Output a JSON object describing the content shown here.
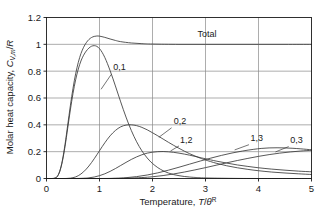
{
  "chart_data": {
    "type": "line",
    "title": "",
    "xlabel": "Temperature, T/θᴿ",
    "xlabel_parts": {
      "prefix": "Temperature, ",
      "var1": "T",
      "slash": "/",
      "var2": "θ",
      "sup": "R"
    },
    "ylabel": "Molar heat capacity, C_V,m/R",
    "ylabel_parts": {
      "prefix": "Molar heat capacity, ",
      "var1": "C",
      "sub": "V,m",
      "slash": "/",
      "var2": "R"
    },
    "xlim": [
      0,
      5
    ],
    "ylim": [
      0,
      1.2
    ],
    "xticks": [
      "0",
      "1",
      "2",
      "3",
      "4",
      "5"
    ],
    "xtick_values": [
      0,
      1,
      2,
      3,
      4,
      5
    ],
    "yticks": [
      "0",
      "0.2",
      "0.4",
      "0.6",
      "0.8",
      "1",
      "1.2"
    ],
    "ytick_values": [
      0,
      0.2,
      0.4,
      0.6,
      0.8,
      1.0,
      1.2
    ],
    "grid": true,
    "grid_color": "#8a8a8a",
    "legend_position": "in-plot-annotations",
    "curve_color": "#3a3a3a",
    "background": "#ffffff",
    "series": [
      {
        "name": "Total",
        "label": "Total",
        "label_x": 2.85,
        "label_y": 1.055,
        "leader": null,
        "points": [
          [
            0.0,
            0.0
          ],
          [
            0.1,
            0.0
          ],
          [
            0.15,
            0.002
          ],
          [
            0.2,
            0.014
          ],
          [
            0.25,
            0.055
          ],
          [
            0.3,
            0.136
          ],
          [
            0.35,
            0.255
          ],
          [
            0.4,
            0.398
          ],
          [
            0.45,
            0.542
          ],
          [
            0.5,
            0.672
          ],
          [
            0.55,
            0.78
          ],
          [
            0.6,
            0.866
          ],
          [
            0.65,
            0.931
          ],
          [
            0.7,
            0.978
          ],
          [
            0.75,
            1.012
          ],
          [
            0.8,
            1.036
          ],
          [
            0.85,
            1.051
          ],
          [
            0.9,
            1.059
          ],
          [
            0.95,
            1.062
          ],
          [
            1.0,
            1.061
          ],
          [
            1.1,
            1.052
          ],
          [
            1.2,
            1.04
          ],
          [
            1.3,
            1.029
          ],
          [
            1.4,
            1.02
          ],
          [
            1.6,
            1.01
          ],
          [
            1.8,
            1.005
          ],
          [
            2.0,
            1.002
          ],
          [
            2.5,
            1.0
          ],
          [
            3.0,
            1.0
          ],
          [
            3.5,
            1.0
          ],
          [
            4.0,
            1.0
          ],
          [
            4.5,
            1.0
          ],
          [
            5.0,
            1.0
          ]
        ]
      },
      {
        "name": "0,1",
        "label": "0,1",
        "label_x": 1.26,
        "label_y": 0.805,
        "leader": [
          [
            1.22,
            0.775
          ],
          [
            1.03,
            0.665
          ]
        ],
        "peak": [
          0.85,
          0.99
        ],
        "points": [
          [
            0.0,
            0.0
          ],
          [
            0.1,
            0.0
          ],
          [
            0.15,
            0.002
          ],
          [
            0.2,
            0.013
          ],
          [
            0.25,
            0.052
          ],
          [
            0.3,
            0.128
          ],
          [
            0.35,
            0.24
          ],
          [
            0.4,
            0.375
          ],
          [
            0.45,
            0.511
          ],
          [
            0.5,
            0.634
          ],
          [
            0.55,
            0.736
          ],
          [
            0.6,
            0.816
          ],
          [
            0.65,
            0.876
          ],
          [
            0.7,
            0.919
          ],
          [
            0.75,
            0.95
          ],
          [
            0.8,
            0.972
          ],
          [
            0.85,
            0.986
          ],
          [
            0.9,
            0.99
          ],
          [
            0.95,
            0.985
          ],
          [
            1.0,
            0.968
          ],
          [
            1.05,
            0.94
          ],
          [
            1.1,
            0.902
          ],
          [
            1.15,
            0.856
          ],
          [
            1.2,
            0.804
          ],
          [
            1.25,
            0.748
          ],
          [
            1.3,
            0.69
          ],
          [
            1.35,
            0.63
          ],
          [
            1.4,
            0.571
          ],
          [
            1.45,
            0.513
          ],
          [
            1.5,
            0.458
          ],
          [
            1.55,
            0.406
          ],
          [
            1.6,
            0.358
          ],
          [
            1.65,
            0.314
          ],
          [
            1.7,
            0.274
          ],
          [
            1.75,
            0.238
          ],
          [
            1.8,
            0.206
          ],
          [
            1.85,
            0.178
          ],
          [
            1.9,
            0.153
          ],
          [
            1.95,
            0.131
          ],
          [
            2.0,
            0.112
          ],
          [
            2.1,
            0.081
          ],
          [
            2.2,
            0.058
          ],
          [
            2.3,
            0.041
          ],
          [
            2.4,
            0.029
          ],
          [
            2.5,
            0.021
          ],
          [
            2.6,
            0.015
          ],
          [
            2.7,
            0.011
          ],
          [
            2.8,
            0.008
          ],
          [
            3.0,
            0.004
          ],
          [
            3.5,
            0.001
          ],
          [
            4.0,
            0.0
          ],
          [
            5.0,
            0.0
          ]
        ]
      },
      {
        "name": "0,2",
        "label": "0,2",
        "label_x": 2.4,
        "label_y": 0.405,
        "leader": [
          [
            2.36,
            0.378
          ],
          [
            2.12,
            0.307
          ]
        ],
        "peak": [
          1.6,
          0.4
        ],
        "points": [
          [
            0.0,
            0.0
          ],
          [
            0.3,
            0.0
          ],
          [
            0.4,
            0.001
          ],
          [
            0.5,
            0.006
          ],
          [
            0.6,
            0.021
          ],
          [
            0.7,
            0.05
          ],
          [
            0.8,
            0.093
          ],
          [
            0.9,
            0.147
          ],
          [
            1.0,
            0.207
          ],
          [
            1.1,
            0.266
          ],
          [
            1.2,
            0.318
          ],
          [
            1.3,
            0.358
          ],
          [
            1.4,
            0.385
          ],
          [
            1.5,
            0.398
          ],
          [
            1.6,
            0.4
          ],
          [
            1.7,
            0.394
          ],
          [
            1.8,
            0.381
          ],
          [
            1.9,
            0.363
          ],
          [
            2.0,
            0.341
          ],
          [
            2.1,
            0.318
          ],
          [
            2.2,
            0.294
          ],
          [
            2.3,
            0.27
          ],
          [
            2.4,
            0.247
          ],
          [
            2.5,
            0.225
          ],
          [
            2.6,
            0.204
          ],
          [
            2.7,
            0.185
          ],
          [
            2.8,
            0.168
          ],
          [
            2.9,
            0.152
          ],
          [
            3.0,
            0.138
          ],
          [
            3.2,
            0.114
          ],
          [
            3.4,
            0.095
          ],
          [
            3.6,
            0.08
          ],
          [
            3.8,
            0.068
          ],
          [
            4.0,
            0.058
          ],
          [
            4.25,
            0.048
          ],
          [
            4.5,
            0.041
          ],
          [
            4.75,
            0.035
          ],
          [
            5.0,
            0.03
          ]
        ]
      },
      {
        "name": "1,2",
        "label": "1,2",
        "label_x": 2.52,
        "label_y": 0.268,
        "leader": [
          [
            2.5,
            0.243
          ],
          [
            2.34,
            0.205
          ]
        ],
        "peak": [
          2.2,
          0.2
        ],
        "points": [
          [
            0.0,
            0.0
          ],
          [
            0.5,
            0.0
          ],
          [
            0.7,
            0.002
          ],
          [
            0.8,
            0.005
          ],
          [
            0.9,
            0.011
          ],
          [
            1.0,
            0.021
          ],
          [
            1.1,
            0.035
          ],
          [
            1.2,
            0.053
          ],
          [
            1.3,
            0.074
          ],
          [
            1.4,
            0.097
          ],
          [
            1.5,
            0.12
          ],
          [
            1.6,
            0.142
          ],
          [
            1.7,
            0.161
          ],
          [
            1.8,
            0.177
          ],
          [
            1.9,
            0.189
          ],
          [
            2.0,
            0.196
          ],
          [
            2.1,
            0.2
          ],
          [
            2.2,
            0.201
          ],
          [
            2.3,
            0.199
          ],
          [
            2.4,
            0.195
          ],
          [
            2.5,
            0.189
          ],
          [
            2.6,
            0.182
          ],
          [
            2.7,
            0.174
          ],
          [
            2.8,
            0.165
          ],
          [
            2.9,
            0.156
          ],
          [
            3.0,
            0.147
          ],
          [
            3.2,
            0.13
          ],
          [
            3.4,
            0.115
          ],
          [
            3.6,
            0.101
          ],
          [
            3.8,
            0.09
          ],
          [
            4.0,
            0.08
          ],
          [
            4.25,
            0.07
          ],
          [
            4.5,
            0.062
          ],
          [
            4.75,
            0.055
          ],
          [
            5.0,
            0.05
          ]
        ]
      },
      {
        "name": "1,3",
        "label": "1,3",
        "label_x": 3.85,
        "label_y": 0.277,
        "leader": [
          [
            3.82,
            0.252
          ],
          [
            3.55,
            0.213
          ]
        ],
        "peak": [
          4.0,
          0.23
        ],
        "points": [
          [
            0.0,
            0.0
          ],
          [
            1.0,
            0.0
          ],
          [
            1.3,
            0.002
          ],
          [
            1.5,
            0.006
          ],
          [
            1.7,
            0.014
          ],
          [
            1.9,
            0.026
          ],
          [
            2.1,
            0.042
          ],
          [
            2.3,
            0.062
          ],
          [
            2.5,
            0.084
          ],
          [
            2.7,
            0.107
          ],
          [
            2.9,
            0.13
          ],
          [
            3.1,
            0.152
          ],
          [
            3.3,
            0.172
          ],
          [
            3.5,
            0.19
          ],
          [
            3.7,
            0.205
          ],
          [
            3.9,
            0.217
          ],
          [
            4.05,
            0.224
          ],
          [
            4.2,
            0.228
          ],
          [
            4.35,
            0.229
          ],
          [
            4.5,
            0.228
          ],
          [
            4.65,
            0.225
          ],
          [
            4.8,
            0.221
          ],
          [
            5.0,
            0.214
          ]
        ]
      },
      {
        "name": "0,3",
        "label": "0,3",
        "label_x": 4.6,
        "label_y": 0.262,
        "leader": [
          [
            4.57,
            0.238
          ],
          [
            4.32,
            0.198
          ]
        ],
        "peak": [
          4.8,
          0.21
        ],
        "points": [
          [
            0.0,
            0.0
          ],
          [
            1.2,
            0.0
          ],
          [
            1.5,
            0.002
          ],
          [
            1.8,
            0.007
          ],
          [
            2.0,
            0.013
          ],
          [
            2.2,
            0.022
          ],
          [
            2.4,
            0.034
          ],
          [
            2.6,
            0.048
          ],
          [
            2.8,
            0.064
          ],
          [
            3.0,
            0.081
          ],
          [
            3.2,
            0.099
          ],
          [
            3.4,
            0.117
          ],
          [
            3.6,
            0.134
          ],
          [
            3.8,
            0.15
          ],
          [
            4.0,
            0.165
          ],
          [
            4.2,
            0.178
          ],
          [
            4.4,
            0.189
          ],
          [
            4.6,
            0.198
          ],
          [
            4.8,
            0.205
          ],
          [
            5.0,
            0.21
          ]
        ]
      }
    ]
  }
}
